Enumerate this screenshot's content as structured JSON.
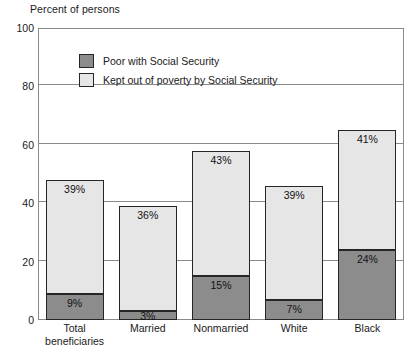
{
  "chart_data": {
    "type": "bar",
    "stacked": true,
    "title": "Percent of persons",
    "xlabel": "",
    "ylabel": "Percent of persons",
    "ylim": [
      0,
      100
    ],
    "yticks": [
      0,
      20,
      40,
      60,
      80,
      100
    ],
    "ytick_labels": [
      "0",
      "20",
      "40",
      "60",
      "80",
      "100"
    ],
    "grid": true,
    "legend_position": "inside-top-left",
    "categories": [
      "Total beneficiaries",
      "Married",
      "Nonmarried",
      "White",
      "Black"
    ],
    "category_lines": [
      [
        "Total",
        "beneficiaries"
      ],
      [
        "Married",
        ""
      ],
      [
        "Nonmarried",
        ""
      ],
      [
        "White",
        ""
      ],
      [
        "Black",
        ""
      ]
    ],
    "series": [
      {
        "name": "Poor with Social Security",
        "color": "#8c8c8c",
        "values": [
          9,
          3,
          15,
          7,
          24
        ],
        "labels": [
          "9%",
          "3%",
          "15%",
          "7%",
          "24%"
        ]
      },
      {
        "name": "Kept out of poverty by Social Security",
        "color": "#e6e6e6",
        "values": [
          39,
          36,
          43,
          39,
          41
        ],
        "labels": [
          "39%",
          "36%",
          "43%",
          "39%",
          "41%"
        ]
      }
    ],
    "totals": [
      48,
      39,
      58,
      46,
      65
    ]
  },
  "legend": {
    "items": [
      {
        "label": "Poor with Social Security",
        "swatch": "dark"
      },
      {
        "label": "Kept out of poverty by Social Security",
        "swatch": "light"
      }
    ]
  },
  "colors": {
    "poor_with_social_security": "#8c8c8c",
    "kept_out_of_poverty": "#e6e6e6",
    "bar_outline": "#262626",
    "grid": "#8a8a8a",
    "text": "#1a1a1a",
    "background": "#ffffff"
  }
}
